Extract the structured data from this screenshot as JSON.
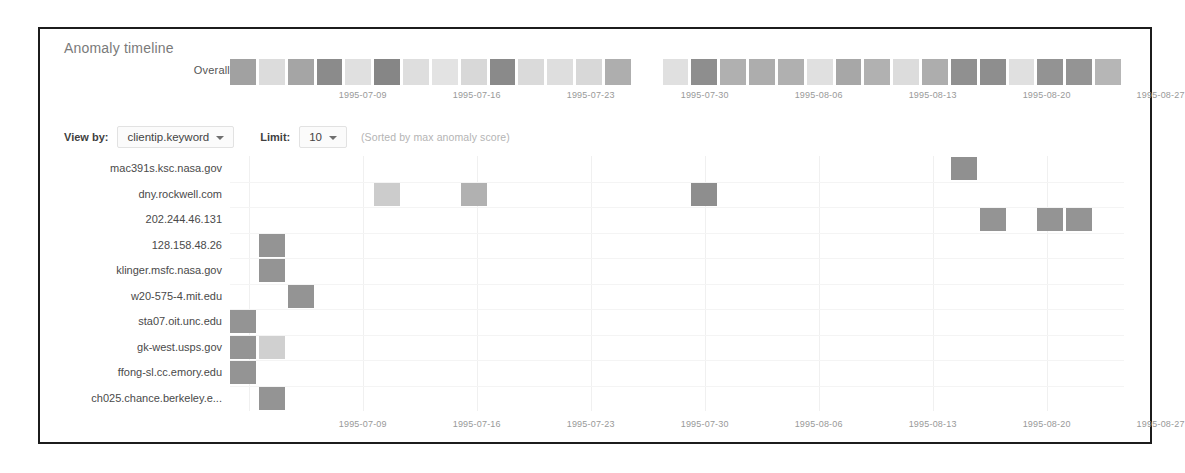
{
  "panel": {
    "title": "Anomaly timeline"
  },
  "overall": {
    "label": "Overall",
    "cells": [
      {
        "i": 0,
        "v": 0.45
      },
      {
        "i": 1,
        "v": 0.08
      },
      {
        "i": 2,
        "v": 0.42
      },
      {
        "i": 3,
        "v": 0.62
      },
      {
        "i": 4,
        "v": 0.06
      },
      {
        "i": 5,
        "v": 0.66
      },
      {
        "i": 6,
        "v": 0.07
      },
      {
        "i": 7,
        "v": 0.05
      },
      {
        "i": 8,
        "v": 0.1
      },
      {
        "i": 9,
        "v": 0.63
      },
      {
        "i": 10,
        "v": 0.09
      },
      {
        "i": 11,
        "v": 0.07
      },
      {
        "i": 12,
        "v": 0.1
      },
      {
        "i": 13,
        "v": 0.35
      },
      {
        "i": 14,
        "v": 0.0
      },
      {
        "i": 15,
        "v": 0.06
      },
      {
        "i": 16,
        "v": 0.6
      },
      {
        "i": 17,
        "v": 0.34
      },
      {
        "i": 18,
        "v": 0.36
      },
      {
        "i": 19,
        "v": 0.34
      },
      {
        "i": 20,
        "v": 0.06
      },
      {
        "i": 21,
        "v": 0.4
      },
      {
        "i": 22,
        "v": 0.33
      },
      {
        "i": 23,
        "v": 0.08
      },
      {
        "i": 24,
        "v": 0.36
      },
      {
        "i": 25,
        "v": 0.58
      },
      {
        "i": 26,
        "v": 0.6
      },
      {
        "i": 27,
        "v": 0.06
      },
      {
        "i": 28,
        "v": 0.56
      },
      {
        "i": 29,
        "v": 0.55
      },
      {
        "i": 30,
        "v": 0.3
      }
    ]
  },
  "controls": {
    "view_by_label": "View by:",
    "view_by_value": "clientip.keyword",
    "limit_label": "Limit:",
    "limit_value": "10",
    "sort_note": "(Sorted by max anomaly score)"
  },
  "axis": {
    "ticks": [
      {
        "label": "1995-07-09",
        "pos": 0.1485
      },
      {
        "label": "1995-07-16",
        "pos": 0.276
      },
      {
        "label": "1995-07-23",
        "pos": 0.4035
      },
      {
        "label": "1995-07-30",
        "pos": 0.531
      },
      {
        "label": "1995-08-06",
        "pos": 0.6585
      },
      {
        "label": "1995-08-13",
        "pos": 0.786
      },
      {
        "label": "1995-08-20",
        "pos": 0.9135
      },
      {
        "label": "1995-08-27",
        "pos": 1.041
      }
    ],
    "gridline_positions": [
      0.021,
      0.1485,
      0.276,
      0.4035,
      0.531,
      0.6585,
      0.786,
      0.9135
    ]
  },
  "chart_data": {
    "type": "heatmap",
    "title": "Anomaly timeline",
    "xlabel": "",
    "ylabel": "clientip.keyword",
    "grid": true,
    "legend": "none",
    "x_tick_labels": [
      "1995-07-09",
      "1995-07-16",
      "1995-07-23",
      "1995-07-30",
      "1995-08-06",
      "1995-08-13",
      "1995-08-20",
      "1995-08-27"
    ],
    "x_bucket_count": 31,
    "categories": [
      "mac391s.ksc.nasa.gov",
      "dny.rockwell.com",
      "202.244.46.131",
      "128.158.48.26",
      "klinger.msfc.nasa.gov",
      "w20-575-4.mit.edu",
      "sta07.oit.unc.edu",
      "gk-west.usps.gov",
      "ffong-sl.cc.emory.edu",
      "ch025.chance.berkeley.e..."
    ],
    "series": [
      {
        "name": "mac391s.ksc.nasa.gov",
        "points": [
          {
            "x": 25,
            "v": 0.58
          }
        ]
      },
      {
        "name": "dny.rockwell.com",
        "points": [
          {
            "x": 5,
            "v": 0.16
          },
          {
            "x": 8,
            "v": 0.33
          },
          {
            "x": 16,
            "v": 0.6
          }
        ]
      },
      {
        "name": "202.244.46.131",
        "points": [
          {
            "x": 26,
            "v": 0.55
          },
          {
            "x": 28,
            "v": 0.55
          },
          {
            "x": 29,
            "v": 0.55
          }
        ]
      },
      {
        "name": "128.158.48.26",
        "points": [
          {
            "x": 1,
            "v": 0.55
          }
        ]
      },
      {
        "name": "klinger.msfc.nasa.gov",
        "points": [
          {
            "x": 1,
            "v": 0.55
          }
        ]
      },
      {
        "name": "w20-575-4.mit.edu",
        "points": [
          {
            "x": 2,
            "v": 0.55
          }
        ]
      },
      {
        "name": "sta07.oit.unc.edu",
        "points": [
          {
            "x": 0,
            "v": 0.55
          }
        ]
      },
      {
        "name": "gk-west.usps.gov",
        "points": [
          {
            "x": 0,
            "v": 0.55
          },
          {
            "x": 1,
            "v": 0.14
          }
        ]
      },
      {
        "name": "ffong-sl.cc.emory.edu",
        "points": [
          {
            "x": 0,
            "v": 0.55
          }
        ]
      },
      {
        "name": "ch025.chance.berkeley.e...",
        "points": [
          {
            "x": 1,
            "v": 0.55
          }
        ]
      }
    ]
  }
}
